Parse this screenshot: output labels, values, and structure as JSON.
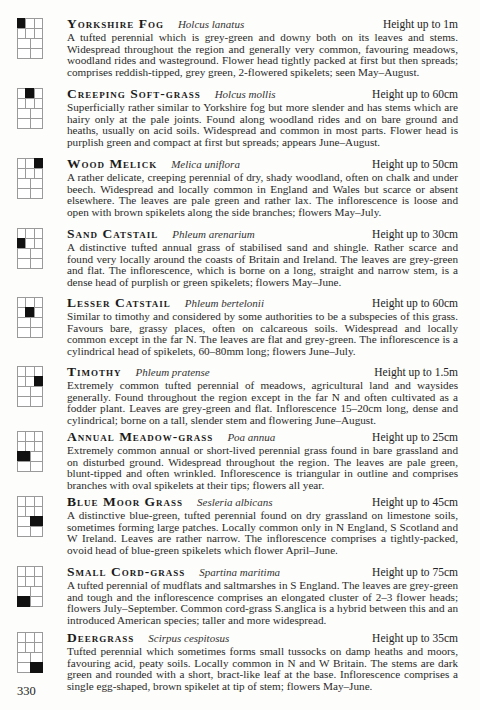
{
  "page_number": "330",
  "entries": [
    {
      "name": "Yorkshire Fog",
      "latin": "Holcus lanatus",
      "height": "Height up to 1m",
      "description": "A tufted perennial which is grey-green and downy both on its leaves and stems. Widespread throughout the region and generally very common, favouring meadows, woodland rides and wasteground. Flower head tightly packed at first but then spreads; comprises reddish-tipped, grey green, 2-flowered spikelets; seen May–August.",
      "grid_highlight": "r0c0"
    },
    {
      "name": "Creeping Soft-grass",
      "latin": "Holcus mollis",
      "height": "Height up to 60cm",
      "description": "Superficially rather similar to Yorkshire fog but more slender and has stems which are hairy only at the pale joints. Found along woodland rides and on bare ground and heaths, usually on acid soils. Widespread and common in most parts. Flower head is purplish green and compact at first but spreads; appears June–August.",
      "grid_highlight": "r0c1"
    },
    {
      "name": "Wood Melick",
      "latin": "Melica uniflora",
      "height": "Height up to 50cm",
      "description": "A rather delicate, creeping perennial of dry, shady woodland, often on chalk and under beech. Widespread and locally common in England and Wales but scarce or absent elsewhere. The leaves are pale green and rather lax. The inflorescence is loose and open with brown spikelets along the side branches; flowers May–July.",
      "grid_highlight": "r0c2"
    },
    {
      "name": "Sand Catstail",
      "latin": "Phleum arenarium",
      "height": "Height up to 30cm",
      "description": "A distinctive tufted annual grass of stabilised sand and shingle. Rather scarce and found very locally around the coasts of Britain and Ireland. The leaves are grey-green and flat. The inflorescence, which is borne on a long, straight and narrow stem, is a dense head of purplish or green spikelets; flowers May–June.",
      "grid_highlight": "r1c0"
    },
    {
      "name": "Lesser Catstail",
      "latin": "Phleum bertelonii",
      "height": "Height up to 60cm",
      "description": "Similar to timothy and considered by some authorities to be a subspecies of this grass. Favours bare, grassy places, often on calcareous soils. Widespread and locally common except in the far N. The leaves are flat and grey-green. The inflorescence is a cylindrical head of spikelets, 60–80mm long; flowers June–July.",
      "grid_highlight": "r1c1"
    },
    {
      "name": "Timothy",
      "latin": "Phleum pratense",
      "height": "Height up to 1.5m",
      "description": "Extremely common tufted perennial of meadows, agricultural land and waysides generally. Found throughout the region except in the far N and often cultivated as a fodder plant. Leaves are grey-green and flat. Inflorescence 15–20cm long, dense and cylindrical; borne on a tall, slender stem and flowering June–August.",
      "grid_highlight": "r1c2"
    },
    {
      "name": "Annual Meadow-grass",
      "latin": "Poa annua",
      "height": "Height up to 25cm",
      "description": "Extremely common annual or short-lived perennial grass found in bare grassland and on disturbed ground. Widespread throughout the region. The leaves are pale green, blunt-tipped and often wrinkled. Inflorescence is triangular in outline and comprises branches with oval spikelets at their tips; flowers all year.",
      "grid_highlight": "r2c0"
    },
    {
      "name": "Blue Moor Grass",
      "latin": "Sesleria albicans",
      "height": "Height up to 45cm",
      "description": "A distinctive blue-green, tufted perennial found on dry grassland on limestone soils, sometimes forming large patches. Locally common only in N England, S Scotland and W Ireland. Leaves are rather narrow. The inflorescence comprises a tightly-packed, ovoid head of blue-green spikelets which flower April–June.",
      "grid_highlight": "r2c1"
    },
    {
      "name": "Small Cord-grass",
      "latin": "Spartina maritima",
      "height": "Height up to 75cm",
      "description": "A tufted perennial of mudflats and saltmarshes in S England. The leaves are grey-green and tough and the inflorescence comprises an elongated cluster of 2–3 flower heads; flowers July–September. Common cord-grass S.anglica is a hybrid between this and an introduced American species; taller and more widespread.",
      "grid_highlight": "r3c0"
    },
    {
      "name": "Deergrass",
      "latin": "Scirpus cespitosus",
      "height": "Height up to 35cm",
      "description": "Tufted perennial which sometimes forms small tussocks on damp heaths and moors, favouring acid, peaty soils. Locally common in N and W Britain. The stems are dark green and rounded with a short, bract-like leaf at the base. Inflorescence comprises a single egg-shaped, brown spikelet at tip of stem; flowers May–June.",
      "grid_highlight": "r3c1"
    }
  ]
}
